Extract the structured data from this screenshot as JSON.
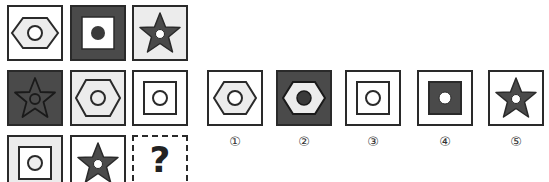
{
  "puzzle": {
    "grid": [
      [
        {
          "bg": "white",
          "shape": "hexagon",
          "shape_fill": "light-gray",
          "center": "white-circle"
        },
        {
          "bg": "dark-gray",
          "shape": "square",
          "shape_fill": "white",
          "center": "dark-dot"
        },
        {
          "bg": "light-gray",
          "shape": "star",
          "shape_fill": "dark-gray",
          "center": "white-circle"
        }
      ],
      [
        {
          "bg": "dark-gray",
          "shape": "star",
          "shape_fill": "dark-gray",
          "center": "outline-circle"
        },
        {
          "bg": "light-gray",
          "shape": "hexagon",
          "shape_fill": "light-gray",
          "center": "outline-circle"
        },
        {
          "bg": "white",
          "shape": "square",
          "shape_fill": "white",
          "center": "outline-circle"
        }
      ],
      [
        {
          "bg": "light-gray",
          "shape": "square",
          "shape_fill": "white",
          "center": "light-circle"
        },
        {
          "bg": "white",
          "shape": "star",
          "shape_fill": "dark-gray",
          "center": "white-circle"
        },
        {
          "unknown": true,
          "label": "?"
        }
      ]
    ],
    "options": [
      {
        "label": "①",
        "bg": "white",
        "shape": "hexagon",
        "shape_fill": "light-gray",
        "center": "white-circle"
      },
      {
        "label": "②",
        "bg": "dark-gray",
        "shape": "hexagon",
        "shape_fill": "light-gray",
        "center": "dark-dot"
      },
      {
        "label": "③",
        "bg": "white",
        "shape": "square",
        "shape_fill": "white",
        "center": "outline-circle"
      },
      {
        "label": "④",
        "bg": "white",
        "shape": "square",
        "shape_fill": "dark-gray",
        "center": "white-circle"
      },
      {
        "label": "⑤",
        "bg": "white",
        "shape": "star",
        "shape_fill": "dark-gray",
        "center": "white-circle"
      }
    ],
    "colors": {
      "border": "#2a2a2a",
      "dark": "#4a4a4a",
      "light": "#ececec",
      "white": "#ffffff"
    }
  }
}
